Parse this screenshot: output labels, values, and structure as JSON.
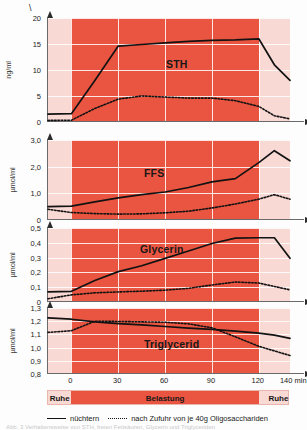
{
  "figure": {
    "corner_mark": "\\",
    "caption_ghost": "Abb. 3   Verhaltensweise von STH, freien Fettsäuren, Glycerin und Triglyceriden"
  },
  "phase_bar": {
    "left_label": "Ruhe",
    "middle_label": "Belastung",
    "right_label": "Ruhe"
  },
  "legend": {
    "solid_label": "nüchtern",
    "dotted_label": "nach Zufuhr von je 40g Oligosacchariden"
  },
  "xaxis": {
    "label": "min",
    "ticks": [
      "0",
      "30",
      "60",
      "90",
      "120",
      "140 min"
    ],
    "tick_values": [
      0,
      30,
      60,
      90,
      120,
      140
    ]
  },
  "chart_data": [
    {
      "type": "line",
      "title": "STH",
      "ylabel": "ng/ml",
      "xlabel": "min",
      "ylim": [
        0,
        20
      ],
      "yticks": [
        0,
        5,
        10,
        15,
        20
      ],
      "ytick_labels": [
        "0",
        "5",
        "10",
        "15",
        "20"
      ],
      "xlim": [
        -15,
        140
      ],
      "grid": true,
      "x": [
        -15,
        0,
        15,
        30,
        45,
        60,
        75,
        90,
        105,
        120,
        130,
        140
      ],
      "series": [
        {
          "name": "nüchtern",
          "style": "solid",
          "values": [
            1.5,
            1.6,
            8.0,
            14.6,
            14.9,
            15.2,
            15.5,
            15.7,
            15.8,
            16.0,
            11.0,
            8.0
          ]
        },
        {
          "name": "nach Zufuhr von je 40g Oligosacchariden",
          "style": "dotted",
          "values": [
            0.3,
            0.35,
            2.6,
            4.4,
            5.0,
            4.8,
            4.6,
            4.6,
            4.1,
            3.0,
            1.2,
            0.6
          ]
        }
      ]
    },
    {
      "type": "line",
      "title": "FFS",
      "ylabel": "µmol/ml",
      "xlabel": "min",
      "ylim": [
        0,
        3.0
      ],
      "yticks": [
        0,
        1.0,
        2.0,
        3.0
      ],
      "ytick_labels": [
        "0",
        "1,0",
        "2,0",
        "3,0"
      ],
      "xlim": [
        -15,
        140
      ],
      "grid": true,
      "x": [
        -15,
        0,
        15,
        30,
        45,
        60,
        75,
        90,
        105,
        120,
        130,
        140
      ],
      "series": [
        {
          "name": "nüchtern",
          "style": "solid",
          "values": [
            0.5,
            0.52,
            0.68,
            0.83,
            0.95,
            1.05,
            1.22,
            1.43,
            1.55,
            2.15,
            2.6,
            2.22
          ]
        },
        {
          "name": "nach Zufuhr von je 40g Oligosacchariden",
          "style": "dotted",
          "values": [
            0.4,
            0.28,
            0.24,
            0.22,
            0.23,
            0.27,
            0.33,
            0.45,
            0.6,
            0.78,
            0.95,
            0.78
          ]
        }
      ]
    },
    {
      "type": "line",
      "title": "Glycerin",
      "ylabel": "µmol/ml",
      "xlabel": "min",
      "ylim": [
        0,
        0.5
      ],
      "yticks": [
        0,
        0.1,
        0.2,
        0.3,
        0.4,
        0.5
      ],
      "ytick_labels": [
        "0",
        "0,1",
        "0,2",
        "0,3",
        "0,4",
        "0,5"
      ],
      "xlim": [
        -15,
        140
      ],
      "grid": true,
      "x": [
        -15,
        0,
        15,
        30,
        45,
        60,
        75,
        90,
        105,
        120,
        130,
        140
      ],
      "series": [
        {
          "name": "nüchtern",
          "style": "solid",
          "values": [
            0.068,
            0.072,
            0.145,
            0.205,
            0.245,
            0.295,
            0.345,
            0.395,
            0.432,
            0.434,
            0.434,
            0.295
          ]
        },
        {
          "name": "nach Zufuhr von je 40g Oligosacchariden",
          "style": "dotted",
          "values": [
            0.022,
            0.048,
            0.062,
            0.068,
            0.073,
            0.08,
            0.092,
            0.115,
            0.135,
            0.128,
            0.105,
            0.082
          ]
        }
      ]
    },
    {
      "type": "line",
      "title": "Triglycerid",
      "ylabel": "µmol/ml",
      "xlabel": "min",
      "ylim": [
        0.8,
        1.3
      ],
      "yticks": [
        0.8,
        0.9,
        1.0,
        1.1,
        1.2,
        1.3
      ],
      "ytick_labels": [
        "0,8",
        "0,9",
        "1,0",
        "1,1",
        "1,2",
        "1,3"
      ],
      "xlim": [
        -15,
        140
      ],
      "grid": true,
      "x": [
        -15,
        0,
        15,
        30,
        45,
        60,
        75,
        90,
        105,
        120,
        130,
        140
      ],
      "series": [
        {
          "name": "nüchtern",
          "style": "solid",
          "values": [
            1.225,
            1.215,
            1.195,
            1.182,
            1.172,
            1.16,
            1.148,
            1.138,
            1.125,
            1.11,
            1.095,
            1.07
          ]
        },
        {
          "name": "nach Zufuhr von je 40g Oligosacchariden",
          "style": "dotted",
          "values": [
            1.115,
            1.128,
            1.2,
            1.198,
            1.195,
            1.192,
            1.18,
            1.15,
            1.082,
            1.01,
            0.975,
            0.94
          ]
        }
      ]
    }
  ]
}
